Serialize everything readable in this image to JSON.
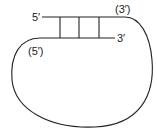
{
  "diagram": {
    "type": "nucleic-acid-strand-loop",
    "labels": {
      "top_left": "5′",
      "top_right": "(3′)",
      "lower_right": "3′",
      "lower_left": "(5′)"
    },
    "base_pair_rungs": 3,
    "line_color": "#222222"
  }
}
